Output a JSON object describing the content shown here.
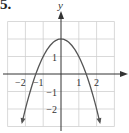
{
  "problem": {
    "number": "5."
  },
  "graph": {
    "function": "y = 2 - x^2",
    "x_label": "y",
    "y_axis_label": "y",
    "x_range": [
      -3,
      3
    ],
    "y_range": [
      -3,
      3
    ],
    "grid_x_range": [
      -3,
      3
    ],
    "grid_y_range": [
      -3,
      3
    ],
    "x_ticks": [
      {
        "value": -2,
        "label": "−2"
      },
      {
        "value": -1,
        "label": "−1"
      },
      {
        "value": 1,
        "label": "1"
      },
      {
        "value": 2,
        "label": "2"
      }
    ],
    "y_ticks": [
      {
        "value": 1,
        "label": "1"
      },
      {
        "value": -1,
        "label": "−1"
      },
      {
        "value": -2,
        "label": "−2"
      }
    ],
    "colors": {
      "grid": "#cfcfcf",
      "axis": "#333333",
      "curve": "#555555"
    }
  },
  "chart_data": {
    "type": "line",
    "title": "",
    "xlabel": "",
    "ylabel": "y",
    "function": "y = 2 - x^2",
    "x": [
      -2.2,
      -2,
      -1.5,
      -1,
      -0.5,
      0,
      0.5,
      1,
      1.5,
      2,
      2.2
    ],
    "series": [
      {
        "name": "y = 2 - x^2",
        "values": [
          -2.84,
          -2,
          -0.25,
          1,
          1.75,
          2,
          1.75,
          1,
          -0.25,
          -2,
          -2.84
        ]
      }
    ],
    "xlim": [
      -3,
      3
    ],
    "ylim": [
      -3,
      3
    ],
    "grid": true,
    "x_tick_labels": [
      "−2",
      "−1",
      "1",
      "2"
    ],
    "y_tick_labels": [
      "1",
      "−1",
      "−2"
    ]
  }
}
